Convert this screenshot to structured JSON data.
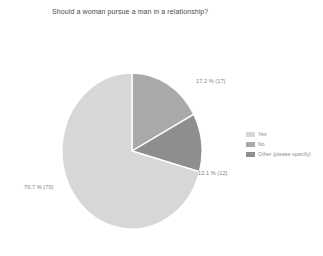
{
  "chart_data": {
    "type": "pie",
    "title": "Should a woman pursue a man in a relationship?",
    "categories": [
      "Yes",
      "No",
      "Other (please specify)"
    ],
    "values": [
      70.7,
      17.2,
      12.1
    ],
    "counts": [
      70,
      17,
      12
    ],
    "total_responses": 99,
    "legend_position": "right",
    "grid": false,
    "xlabel": "",
    "ylabel": "",
    "slices": [
      {
        "label": "Yes",
        "percent": 70.7,
        "count": 70,
        "data_label": "70.7 % (70)",
        "color": "#d7d7d7"
      },
      {
        "label": "No",
        "percent": 17.2,
        "count": 17,
        "data_label": "17.2 % (17)",
        "color": "#a9a9a9"
      },
      {
        "label": "Other (please specify)",
        "percent": 12.1,
        "count": 12,
        "data_label": "12.1 % (12)",
        "color": "#8e8e8e"
      }
    ]
  },
  "legend": {
    "items": [
      {
        "label": "Yes",
        "color": "#d7d7d7"
      },
      {
        "label": "No",
        "color": "#a9a9a9"
      },
      {
        "label": "Other (please specify)",
        "color": "#8e8e8e"
      }
    ]
  },
  "colors": {
    "slice_yes": "#d7d7d7",
    "slice_no": "#a9a9a9",
    "slice_other": "#8e8e8e",
    "title_text": "#4a4a4a",
    "label_text": "#7d7d7d",
    "legend_text": "#8a8a8a",
    "background": "#ffffff",
    "slice_border": "#ffffff"
  }
}
